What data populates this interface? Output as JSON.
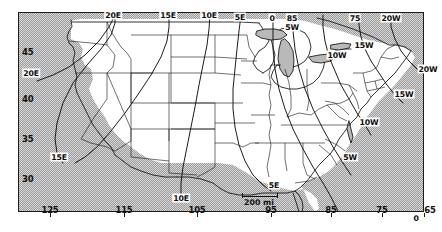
{
  "map": {
    "title": "United States magnetic declination isogonic chart",
    "projection_note": "conic",
    "frame": {
      "x": 18,
      "y": 12,
      "w": 406,
      "h": 200
    },
    "ocean_color": "#b9b9b9",
    "land_color": "#ffffff",
    "line_color": "#111111"
  },
  "axes": {
    "latitude": {
      "unit": "degrees north",
      "ticks": [
        {
          "label": "45",
          "x": 22,
          "y": 47
        },
        {
          "label": "40",
          "x": 22,
          "y": 94
        },
        {
          "label": "35",
          "x": 22,
          "y": 134
        },
        {
          "label": "30",
          "x": 22,
          "y": 174
        }
      ]
    },
    "longitude_bottom": {
      "unit": "degrees west",
      "ticks": [
        {
          "label": "125",
          "x": 50,
          "y": 205
        },
        {
          "label": "115",
          "x": 124,
          "y": 205
        },
        {
          "label": "105",
          "x": 197,
          "y": 205
        },
        {
          "label": "95",
          "x": 271,
          "y": 205
        },
        {
          "label": "85",
          "x": 331,
          "y": 205
        },
        {
          "label": "75",
          "x": 382,
          "y": 205
        },
        {
          "label": "65",
          "x": 430,
          "y": 205
        }
      ]
    },
    "longitude_top": {
      "ticks": [
        {
          "label": "0",
          "x": 272,
          "y": 16
        },
        {
          "label": "85",
          "x": 292,
          "y": 16
        },
        {
          "label": "75",
          "x": 355,
          "y": 16
        },
        {
          "label": "0",
          "x": 416,
          "y": 216
        }
      ]
    }
  },
  "isogonic_labels": [
    {
      "label": "20E",
      "x": 113,
      "y": 15
    },
    {
      "label": "15E",
      "x": 168,
      "y": 15
    },
    {
      "label": "10E",
      "x": 209,
      "y": 15
    },
    {
      "label": "5E",
      "x": 240,
      "y": 17
    },
    {
      "label": "20E",
      "x": 31,
      "y": 73
    },
    {
      "label": "15E",
      "x": 59,
      "y": 157
    },
    {
      "label": "10E",
      "x": 181,
      "y": 198
    },
    {
      "label": "5E",
      "x": 274,
      "y": 185
    },
    {
      "label": "5W",
      "x": 292,
      "y": 26
    },
    {
      "label": "20W",
      "x": 391,
      "y": 18
    },
    {
      "label": "15W",
      "x": 364,
      "y": 45
    },
    {
      "label": "10W",
      "x": 337,
      "y": 55
    },
    {
      "label": "20W",
      "x": 428,
      "y": 69
    },
    {
      "label": "15W",
      "x": 404,
      "y": 94
    },
    {
      "label": "10W",
      "x": 369,
      "y": 122
    },
    {
      "label": "5W",
      "x": 350,
      "y": 157
    }
  ],
  "scale": {
    "text": "200 mi",
    "x1": 242,
    "x2": 277,
    "y": 196,
    "label_x": 259,
    "label_y": 198
  }
}
